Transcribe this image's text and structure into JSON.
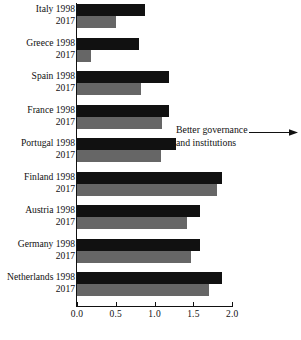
{
  "chart_data": {
    "type": "bar",
    "orientation": "horizontal",
    "title": "",
    "subtitle": "",
    "xlabel": "",
    "ylabel": "",
    "xlim": [
      0.0,
      2.0
    ],
    "xticks": [
      0.0,
      0.5,
      1.0,
      1.5,
      2.0
    ],
    "xtick_labels": [
      "0.0",
      "0.5",
      "1.0",
      "1.5",
      "2.0"
    ],
    "grid": false,
    "legend": null,
    "categories": [
      "Italy",
      "Greece",
      "Spain",
      "France",
      "Portugal",
      "Finland",
      "Austria",
      "Germany",
      "Netherlands"
    ],
    "series": [
      {
        "name": "1998",
        "color": "#111111",
        "values": [
          0.88,
          0.8,
          1.18,
          1.18,
          1.27,
          1.87,
          1.58,
          1.58,
          1.87
        ]
      },
      {
        "name": "2017",
        "color": "#666666",
        "values": [
          0.5,
          0.18,
          0.82,
          1.1,
          1.08,
          1.8,
          1.42,
          1.47,
          1.7
        ]
      }
    ],
    "annotations": [
      {
        "text_line1": "Better governance",
        "text_line2": "and institutions",
        "arrow": "right"
      }
    ]
  },
  "groups": [
    {
      "country": "Italy",
      "rows": [
        {
          "label": "Italy 1998",
          "series": "1998",
          "value": 0.88
        },
        {
          "label": "2017",
          "series": "2017",
          "value": 0.5
        }
      ]
    },
    {
      "country": "Greece",
      "rows": [
        {
          "label": "Greece 1998",
          "series": "1998",
          "value": 0.8
        },
        {
          "label": "2017",
          "series": "2017",
          "value": 0.18
        }
      ]
    },
    {
      "country": "Spain",
      "rows": [
        {
          "label": "Spain 1998",
          "series": "1998",
          "value": 1.18
        },
        {
          "label": "2017",
          "series": "2017",
          "value": 0.82
        }
      ]
    },
    {
      "country": "France",
      "rows": [
        {
          "label": "France 1998",
          "series": "1998",
          "value": 1.18
        },
        {
          "label": "2017",
          "series": "2017",
          "value": 1.1
        }
      ]
    },
    {
      "country": "Portugal",
      "rows": [
        {
          "label": "Portugal 1998",
          "series": "1998",
          "value": 1.27
        },
        {
          "label": "2017",
          "series": "2017",
          "value": 1.08
        }
      ]
    },
    {
      "country": "Finland",
      "rows": [
        {
          "label": "Finland 1998",
          "series": "1998",
          "value": 1.87
        },
        {
          "label": "2017",
          "series": "2017",
          "value": 1.8
        }
      ]
    },
    {
      "country": "Austria",
      "rows": [
        {
          "label": "Austria 1998",
          "series": "1998",
          "value": 1.58
        },
        {
          "label": "2017",
          "series": "2017",
          "value": 1.42
        }
      ]
    },
    {
      "country": "Germany",
      "rows": [
        {
          "label": "Germany 1998",
          "series": "1998",
          "value": 1.58
        },
        {
          "label": "2017",
          "series": "2017",
          "value": 1.47
        }
      ]
    },
    {
      "country": "Netherlands",
      "rows": [
        {
          "label": "Netherlands 1998",
          "series": "1998",
          "value": 1.87
        },
        {
          "label": "2017",
          "series": "2017",
          "value": 1.7
        }
      ]
    }
  ],
  "axis": {
    "ticks": [
      "0.0",
      "0.5",
      "1.0",
      "1.5",
      "2.0"
    ]
  },
  "annotation": {
    "line1": "Better governance",
    "line2": "and institutions"
  },
  "colors": {
    "bar_1998": "#111111",
    "bar_2017": "#666666",
    "axis": "#111111",
    "background": "#ffffff"
  }
}
